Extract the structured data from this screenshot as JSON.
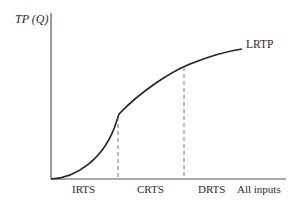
{
  "diagram": {
    "type": "long-run total product curve",
    "y_axis_label": "TP (Q)",
    "x_axis_label": "All inputs",
    "curve_label": "LRTP",
    "regions": [
      {
        "label": "IRTS"
      },
      {
        "label": "CRTS"
      },
      {
        "label": "DRTS"
      }
    ],
    "colors": {
      "axis": "#555555",
      "curve": "#222222",
      "dashed": "#666666",
      "text": "#2a2a2a"
    }
  }
}
